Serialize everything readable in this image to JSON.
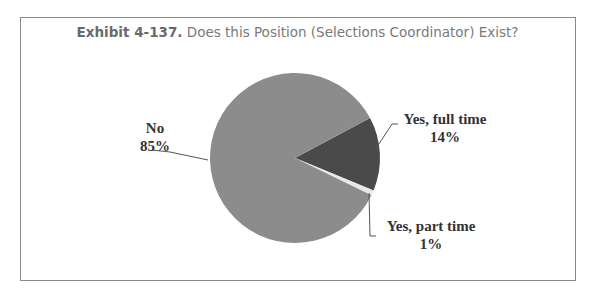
{
  "title": {
    "exhibit": "Exhibit 4-137.",
    "text": "Does this Position (Selections Coordinator) Exist?"
  },
  "chart_data": {
    "type": "pie",
    "title": "Exhibit 4-137. Does this Position (Selections Coordinator) Exist?",
    "categories": [
      "Yes, full time",
      "Yes, part time",
      "No"
    ],
    "values": [
      14,
      1,
      85
    ],
    "unit": "%",
    "colors": [
      "#4a4a4a",
      "#e8e8e8",
      "#8c8c8c"
    ],
    "labels": [
      {
        "name": "Yes, full time",
        "value": "14%"
      },
      {
        "name": "Yes, part time",
        "value": "1%"
      },
      {
        "name": "No",
        "value": "85%"
      }
    ],
    "legend": "none (callout labels)"
  }
}
